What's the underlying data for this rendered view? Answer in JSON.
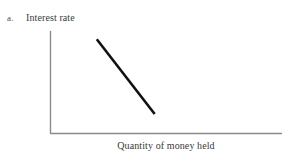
{
  "figure": {
    "part_letter": "a.",
    "background_color": "#ffffff"
  },
  "chart_data": {
    "type": "line",
    "title": "",
    "subtitle": "",
    "xlabel": "Quantity of money held",
    "ylabel": "Interest rate",
    "xlim": [
      0,
      100
    ],
    "ylim": [
      0,
      100
    ],
    "grid": false,
    "legend": "none",
    "xticks": [],
    "yticks": [],
    "xticklabels": [],
    "yticklabels": [],
    "axis_color": "#8a8a8a",
    "series": [
      {
        "name": "Money demand",
        "color": "#111111",
        "linewidth": 2.6,
        "x": [
          20,
          45
        ],
        "y": [
          92,
          19
        ],
        "annotation": ""
      }
    ],
    "annotations": []
  },
  "axes": {
    "y_axis_name": "interest-rate-axis",
    "x_axis_name": "quantity-of-money-held-axis"
  }
}
